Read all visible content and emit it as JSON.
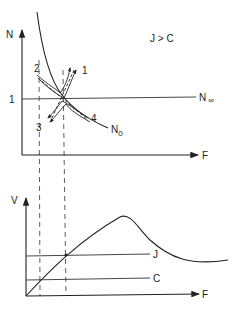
{
  "top_panel": {
    "y_axis_label": "N",
    "x_axis_label": "F",
    "condition_label": "J > C",
    "y_tick_label": "1",
    "asymptote_label": "N",
    "asymptote_subscript": "∞",
    "curve_label": "N",
    "curve_subscript": "0",
    "trajectory_labels": [
      "1",
      "2",
      "3",
      "4"
    ]
  },
  "bottom_panel": {
    "y_axis_label": "V",
    "x_axis_label": "F",
    "line_labels": [
      "J",
      "C"
    ]
  }
}
